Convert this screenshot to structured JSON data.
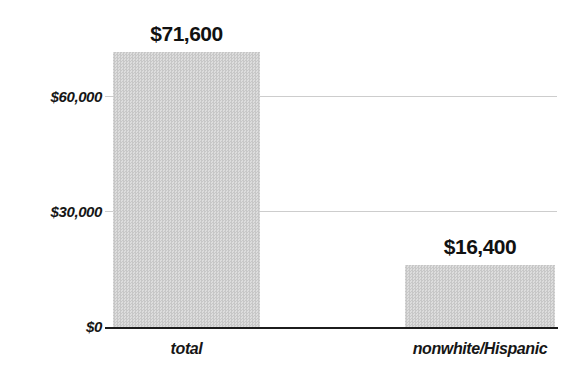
{
  "chart_data": {
    "type": "bar",
    "title": "",
    "xlabel": "",
    "ylabel": "",
    "categories": [
      "total",
      "nonwhite/Hispanic"
    ],
    "values": [
      71600,
      16400
    ],
    "value_labels": [
      "$71,600",
      "$16,400"
    ],
    "yticks": [
      {
        "value": 0,
        "label": "$0"
      },
      {
        "value": 30000,
        "label": "$30,000"
      },
      {
        "value": 60000,
        "label": "$60,000"
      }
    ],
    "ylim": [
      0,
      75000
    ],
    "grid": "horizontal",
    "legend": "none",
    "bar_color": "#d2d2d2",
    "bar_texture": "halftone-checker",
    "grid_color": "#cdcdcd",
    "axis_color": "#1c1c1c",
    "text_color": "#161616"
  }
}
